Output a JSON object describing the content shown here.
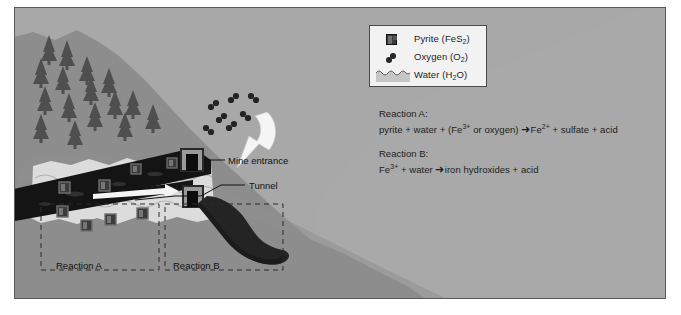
{
  "figure": {
    "title_alt": "Acid mine drainage reactions diagram",
    "background_color": "#9a9a9a",
    "border_color": "#5a5a5a"
  },
  "legend": {
    "items": [
      {
        "icon": "pyrite-cube-icon",
        "label": "Pyrite (FeS",
        "sub": "2",
        "tail": ")"
      },
      {
        "icon": "oxygen-molecule-icon",
        "label": "Oxygen (O",
        "sub": "2",
        "tail": ")"
      },
      {
        "icon": "water-band-icon",
        "label": "Water (H",
        "sub": "2",
        "tail": "O)"
      }
    ]
  },
  "reactions": {
    "a_heading": "Reaction A:",
    "a_left": "pyrite + water + (Fe",
    "a_left_sup": "3+",
    "a_left_rest": " or oxygen)",
    "a_arrow": "➜",
    "a_right_pre": "Fe",
    "a_right_sup": "2+",
    "a_right_rest": " + sulfate + acid",
    "b_heading": "Reaction B:",
    "b_left_pre": "Fe",
    "b_left_sup": "3+",
    "b_left_rest": " + water",
    "b_arrow": "➜",
    "b_right": "iron hydroxides + acid"
  },
  "map_labels": {
    "mine_entrance": "Mine entrance",
    "tunnel": "Tunnel",
    "reaction_a": "Reaction A",
    "reaction_b": "Reaction B"
  },
  "colors": {
    "sky": "#a8a8a8",
    "hillside": "#8d8d8d",
    "bedrock": "#7e7e7e",
    "water_table": "#d9d9d9",
    "tunnel_dark": "#1a1a1a",
    "drainage": "#262626",
    "tree": "#4a4a4a",
    "legend_bg": "#f2f2f2",
    "text": "#1d1d1d"
  }
}
